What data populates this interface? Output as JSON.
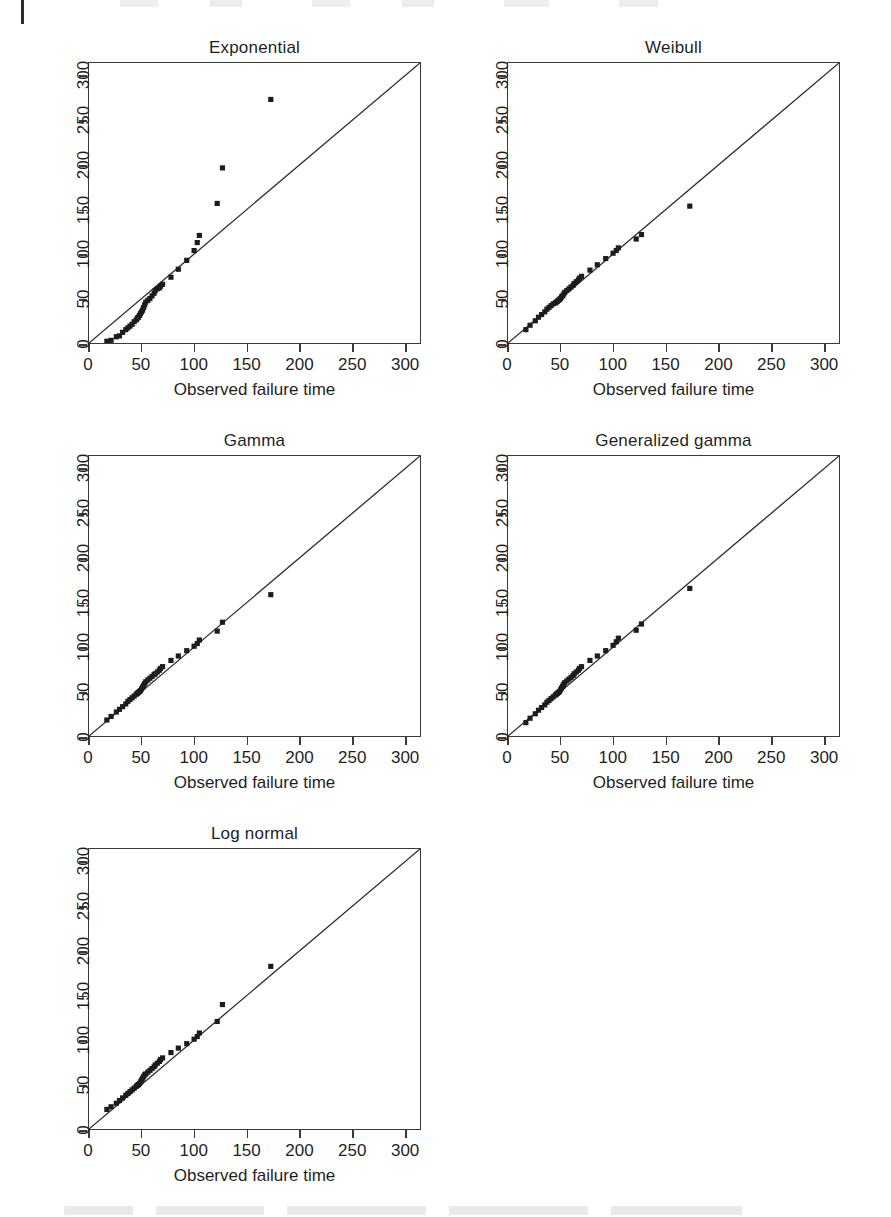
{
  "figure": {
    "axis_caption": "Observed failure time",
    "xlabel": "Observed failure time",
    "ylabel": "",
    "xlim": [
      0,
      315
    ],
    "ylim": [
      0,
      315
    ],
    "xticks": [
      0,
      50,
      100,
      150,
      200,
      250,
      300
    ],
    "yticks": [
      0,
      50,
      100,
      150,
      200,
      250,
      300
    ],
    "xtick_labels": [
      "0",
      "50",
      "100",
      "150",
      "200",
      "250",
      "300"
    ],
    "ytick_labels": [
      "0",
      "50",
      "100",
      "150",
      "200",
      "250",
      "300"
    ],
    "reference_line": "y = x",
    "marker": "filled-square",
    "marker_color": "#1c1c1c",
    "line_color": "#2b2b2b",
    "box_color": "#3a3a3a"
  },
  "chart_data": [
    {
      "type": "scatter",
      "title": "Exponential",
      "xlabel": "Observed failure time",
      "ylabel": "",
      "xlim": [
        0,
        315
      ],
      "ylim": [
        0,
        315
      ],
      "grid": false,
      "legend": "none",
      "reference_line": {
        "type": "identity",
        "from": [
          0,
          0
        ],
        "to": [
          315,
          315
        ]
      },
      "x": [
        17,
        21,
        26,
        29,
        32,
        35,
        37,
        39,
        41,
        43,
        45,
        46,
        47,
        48,
        49,
        50,
        51,
        52,
        53,
        54,
        56,
        58,
        60,
        62,
        63,
        65,
        67,
        68,
        70,
        78,
        85,
        93,
        100,
        103,
        105,
        122,
        127,
        173
      ],
      "y": [
        2,
        3,
        7,
        8,
        12,
        15,
        17,
        19,
        21,
        24,
        26,
        28,
        29,
        31,
        33,
        35,
        37,
        40,
        43,
        46,
        48,
        50,
        53,
        56,
        59,
        61,
        62,
        64,
        66,
        74,
        83,
        93,
        104,
        113,
        121,
        157,
        197,
        274
      ]
    },
    {
      "type": "scatter",
      "title": "Weibull",
      "xlabel": "Observed failure time",
      "ylabel": "",
      "xlim": [
        0,
        315
      ],
      "ylim": [
        0,
        315
      ],
      "grid": false,
      "legend": "none",
      "reference_line": {
        "type": "identity",
        "from": [
          0,
          0
        ],
        "to": [
          315,
          315
        ]
      },
      "x": [
        17,
        21,
        26,
        29,
        32,
        35,
        37,
        39,
        41,
        43,
        45,
        46,
        47,
        48,
        49,
        50,
        51,
        52,
        53,
        54,
        56,
        58,
        60,
        62,
        63,
        65,
        67,
        68,
        70,
        78,
        85,
        93,
        100,
        103,
        105,
        122,
        127,
        173
      ],
      "y": [
        15,
        20,
        25,
        29,
        32,
        35,
        38,
        40,
        42,
        44,
        45,
        46,
        47,
        48,
        49,
        50,
        52,
        53,
        55,
        57,
        59,
        61,
        63,
        65,
        67,
        69,
        71,
        73,
        75,
        82,
        88,
        95,
        101,
        104,
        107,
        117,
        122,
        154
      ]
    },
    {
      "type": "scatter",
      "title": "Gamma",
      "xlabel": "Observed failure time",
      "ylabel": "",
      "xlim": [
        0,
        315
      ],
      "ylim": [
        0,
        315
      ],
      "grid": false,
      "legend": "none",
      "reference_line": {
        "type": "identity",
        "from": [
          0,
          0
        ],
        "to": [
          315,
          315
        ]
      },
      "x": [
        17,
        21,
        26,
        29,
        32,
        35,
        37,
        39,
        41,
        43,
        45,
        46,
        47,
        48,
        49,
        50,
        51,
        52,
        53,
        54,
        56,
        58,
        60,
        62,
        63,
        65,
        67,
        68,
        70,
        78,
        85,
        93,
        100,
        103,
        105,
        122,
        127,
        173
      ],
      "y": [
        18,
        22,
        27,
        30,
        33,
        36,
        39,
        41,
        43,
        45,
        47,
        48,
        49,
        50,
        51,
        53,
        55,
        57,
        59,
        61,
        63,
        65,
        67,
        69,
        70,
        72,
        74,
        76,
        78,
        85,
        90,
        96,
        101,
        104,
        108,
        118,
        128,
        159
      ]
    },
    {
      "type": "scatter",
      "title": "Generalized gamma",
      "xlabel": "Observed failure time",
      "ylabel": "",
      "xlim": [
        0,
        315
      ],
      "ylim": [
        0,
        315
      ],
      "grid": false,
      "legend": "none",
      "reference_line": {
        "type": "identity",
        "from": [
          0,
          0
        ],
        "to": [
          315,
          315
        ]
      },
      "x": [
        17,
        21,
        26,
        29,
        32,
        35,
        37,
        39,
        41,
        43,
        45,
        46,
        47,
        48,
        49,
        50,
        51,
        52,
        53,
        54,
        56,
        58,
        60,
        62,
        63,
        65,
        67,
        68,
        70,
        78,
        85,
        93,
        100,
        103,
        105,
        122,
        127,
        173
      ],
      "y": [
        15,
        20,
        25,
        29,
        32,
        35,
        38,
        40,
        42,
        44,
        46,
        47,
        48,
        49,
        50,
        52,
        54,
        56,
        58,
        60,
        62,
        64,
        66,
        68,
        70,
        72,
        74,
        76,
        78,
        85,
        90,
        96,
        102,
        106,
        110,
        119,
        126,
        166
      ]
    },
    {
      "type": "scatter",
      "title": "Log normal",
      "xlabel": "Observed failure time",
      "ylabel": "",
      "xlim": [
        0,
        315
      ],
      "ylim": [
        0,
        315
      ],
      "grid": false,
      "legend": "none",
      "reference_line": {
        "type": "identity",
        "from": [
          0,
          0
        ],
        "to": [
          315,
          315
        ]
      },
      "x": [
        17,
        21,
        26,
        29,
        32,
        35,
        37,
        39,
        41,
        43,
        45,
        46,
        47,
        48,
        49,
        50,
        51,
        52,
        53,
        54,
        56,
        58,
        60,
        62,
        63,
        65,
        67,
        68,
        70,
        78,
        85,
        93,
        100,
        103,
        105,
        122,
        127,
        173
      ],
      "y": [
        22,
        25,
        29,
        32,
        35,
        38,
        40,
        42,
        44,
        46,
        48,
        49,
        50,
        51,
        53,
        55,
        57,
        59,
        61,
        62,
        64,
        66,
        68,
        70,
        72,
        74,
        76,
        78,
        80,
        86,
        91,
        96,
        101,
        104,
        108,
        121,
        140,
        183
      ]
    }
  ],
  "panels": [
    {
      "title": "Exponential"
    },
    {
      "title": "Weibull"
    },
    {
      "title": "Gamma"
    },
    {
      "title": "Generalized gamma"
    },
    {
      "title": "Log normal"
    }
  ]
}
